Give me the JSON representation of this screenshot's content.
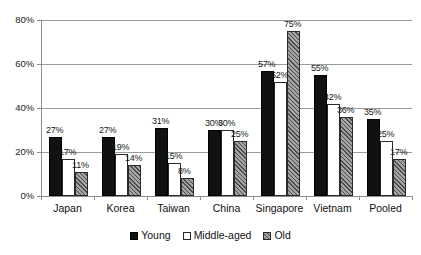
{
  "chart_data": {
    "type": "bar",
    "title": "",
    "xlabel": "",
    "ylabel": "",
    "categories": [
      "Japan",
      "Korea",
      "Taiwan",
      "China",
      "Singapore",
      "Vietnam",
      "Pooled"
    ],
    "series": [
      {
        "name": "Young",
        "values": [
          27,
          27,
          31,
          30,
          57,
          55,
          35
        ]
      },
      {
        "name": "Middle-aged",
        "values": [
          17,
          19,
          15,
          30,
          52,
          42,
          25
        ]
      },
      {
        "name": "Old",
        "values": [
          11,
          14,
          8,
          25,
          75,
          36,
          17
        ]
      }
    ],
    "data_labels": [
      [
        "27%",
        "17%",
        "11%"
      ],
      [
        "27%",
        "19%",
        "14%"
      ],
      [
        "31%",
        "15%",
        "8%"
      ],
      [
        "30%",
        "30%",
        "25%"
      ],
      [
        "57%",
        "52%",
        "75%"
      ],
      [
        "55%",
        "42%",
        "36%"
      ],
      [
        "35%",
        "25%",
        "17%"
      ]
    ],
    "ylim": [
      0,
      80
    ],
    "yticks": [
      0,
      20,
      40,
      60,
      80
    ],
    "ytick_labels": [
      "0%",
      "20%",
      "40%",
      "60%",
      "80%"
    ],
    "grid": true,
    "legend_position": "bottom",
    "colors": {
      "young": "#111111",
      "middle_aged": "#ffffff",
      "old": "#7d7d7d",
      "gridline": "#9a9a9a",
      "axis": "#8d8d8d",
      "text": "#111111",
      "background": "#ffffff"
    }
  }
}
